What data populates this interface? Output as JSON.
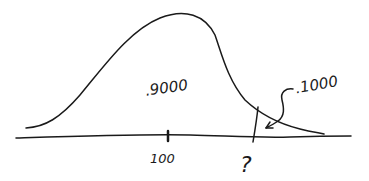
{
  "diagram": {
    "type": "normal-distribution-sketch",
    "style": "hand-drawn",
    "ink_color": "#1a1a1a",
    "background": "#ffffff",
    "labels": {
      "body_area": ".9000",
      "tail_area": ".1000",
      "mean_tick": "100",
      "cutoff": "?"
    }
  }
}
